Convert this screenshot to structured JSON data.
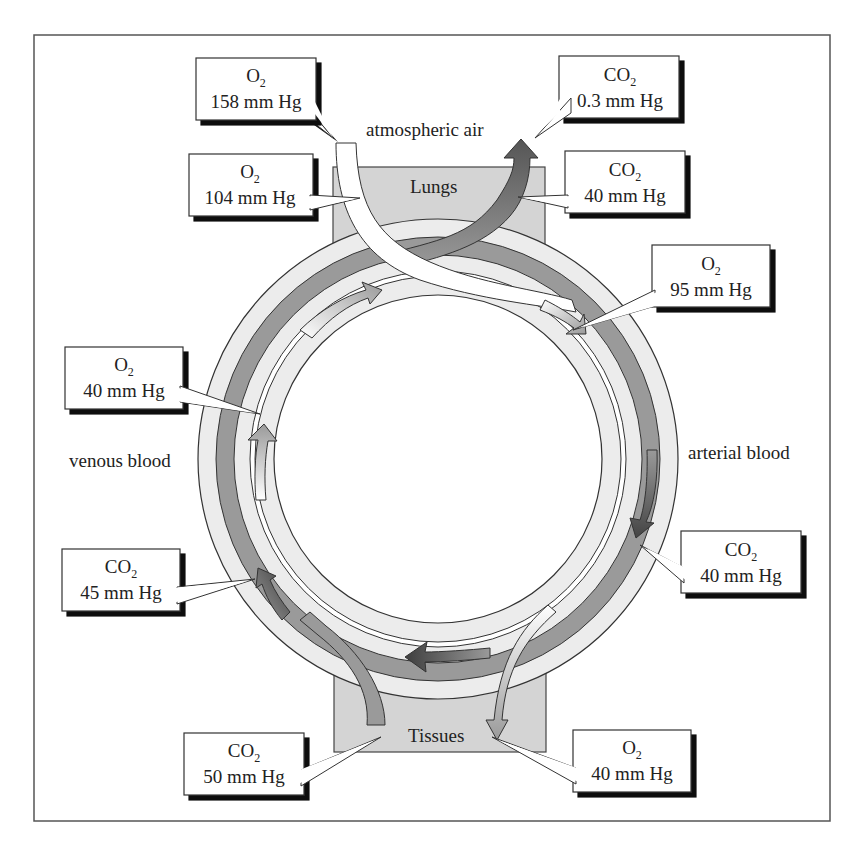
{
  "diagram": {
    "title_labels": {
      "atmospheric_air": "atmospheric air",
      "lungs": "Lungs",
      "tissues": "Tissues",
      "venous_blood": "venous blood",
      "arterial_blood": "arterial blood"
    },
    "callouts": [
      {
        "id": "o2-atmosphere",
        "gas": "O",
        "sub": "2",
        "value": "158 mm Hg",
        "location": "atmospheric air"
      },
      {
        "id": "co2-atmosphere",
        "gas": "CO",
        "sub": "2",
        "value": "0.3 mm Hg",
        "location": "atmospheric air"
      },
      {
        "id": "o2-alveoli",
        "gas": "O",
        "sub": "2",
        "value": "104 mm Hg",
        "location": "lungs"
      },
      {
        "id": "co2-alveoli",
        "gas": "CO",
        "sub": "2",
        "value": "40 mm Hg",
        "location": "lungs"
      },
      {
        "id": "o2-arterial",
        "gas": "O",
        "sub": "2",
        "value": "95 mm Hg",
        "location": "arterial blood"
      },
      {
        "id": "o2-venous",
        "gas": "O",
        "sub": "2",
        "value": "40 mm Hg",
        "location": "venous blood"
      },
      {
        "id": "co2-venous",
        "gas": "CO",
        "sub": "2",
        "value": "45 mm Hg",
        "location": "venous blood"
      },
      {
        "id": "co2-arterial",
        "gas": "CO",
        "sub": "2",
        "value": "40 mm Hg",
        "location": "arterial blood"
      },
      {
        "id": "co2-tissues",
        "gas": "CO",
        "sub": "2",
        "value": "50 mm Hg",
        "location": "tissues"
      },
      {
        "id": "o2-tissues",
        "gas": "O",
        "sub": "2",
        "value": "40 mm Hg",
        "location": "tissues"
      }
    ],
    "colors": {
      "frame": "#555555",
      "organ_box": "#d4d4d4",
      "ring_light": "#ececec",
      "ring_dark": "#9a9a9a",
      "co2_arrow_dark": "#555555",
      "o2_arrow_light": "#ffffff",
      "outline": "#333333"
    }
  }
}
